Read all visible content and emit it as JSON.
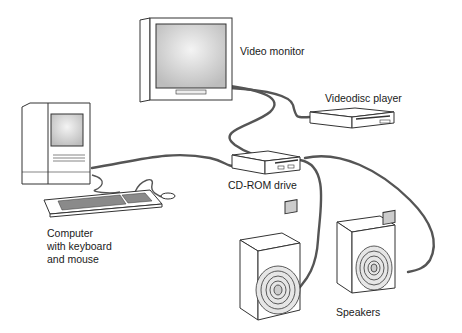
{
  "diagram": {
    "components": [
      {
        "id": "video-monitor",
        "label": "Video monitor"
      },
      {
        "id": "videodisc-player",
        "label": "Videodisc player"
      },
      {
        "id": "cdrom-drive",
        "label": "CD-ROM drive"
      },
      {
        "id": "computer",
        "label_lines": [
          "Computer",
          "with keyboard",
          "and mouse"
        ]
      },
      {
        "id": "speakers",
        "label": "Speakers"
      }
    ],
    "connections": [
      [
        "video-monitor",
        "videodisc-player"
      ],
      [
        "video-monitor",
        "cdrom-drive"
      ],
      [
        "computer",
        "cdrom-drive"
      ],
      [
        "cdrom-drive",
        "speakers"
      ],
      [
        "computer",
        "keyboard"
      ],
      [
        "keyboard",
        "mouse"
      ]
    ],
    "colors": {
      "line": "#333333",
      "fill": "#ffffff",
      "screen": "#d9d9d9",
      "cable": "#555555"
    }
  }
}
